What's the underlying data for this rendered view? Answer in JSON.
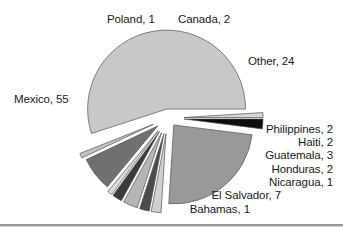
{
  "chart_data": {
    "type": "pie",
    "title": "",
    "subtitle": "",
    "xlabel": "",
    "ylabel": "",
    "legend_position": "none",
    "grid": false,
    "label_format": "{name}, {value}",
    "total": 100,
    "categories": [
      "Mexico",
      "Poland",
      "Canada",
      "Other",
      "Philippines",
      "Haiti",
      "Guatemala",
      "Honduras",
      "Nicaragua",
      "El Salvador",
      "Bahamas"
    ],
    "values": [
      55,
      1,
      2,
      24,
      2,
      2,
      3,
      2,
      1,
      7,
      1
    ],
    "slices": [
      {
        "name": "Mexico",
        "value": 55,
        "label": "Mexico, 55",
        "color": "#c8c8c8",
        "start_angle": 162,
        "end_angle": 360,
        "exploded": true
      },
      {
        "name": "Poland",
        "value": 1,
        "label": "Poland, 1",
        "color": "#d6d6d6",
        "start_angle": 356.4,
        "end_angle": 360,
        "exploded": true
      },
      {
        "name": "Canada",
        "value": 2,
        "label": "Canada, 2",
        "color": "#0d0d0d",
        "start_angle": 0,
        "end_angle": 7.2,
        "exploded": true
      },
      {
        "name": "Other",
        "value": 24,
        "label": "Other, 24",
        "color": "#999999",
        "start_angle": 7.2,
        "end_angle": 93.6,
        "exploded": true
      },
      {
        "name": "Philippines",
        "value": 2,
        "label": "Philippines, 2",
        "color": "#d0d0d0",
        "start_angle": 93.6,
        "end_angle": 100.8,
        "exploded": true
      },
      {
        "name": "Haiti",
        "value": 2,
        "label": "Haiti, 2",
        "color": "#4a4a4a",
        "start_angle": 100.8,
        "end_angle": 108,
        "exploded": true
      },
      {
        "name": "Guatemala",
        "value": 3,
        "label": "Guatemala, 3",
        "color": "#b5b5b5",
        "start_angle": 108,
        "end_angle": 118.8,
        "exploded": true
      },
      {
        "name": "Honduras",
        "value": 2,
        "label": "Honduras, 2",
        "color": "#3a3a3a",
        "start_angle": 118.8,
        "end_angle": 126,
        "exploded": true
      },
      {
        "name": "Nicaragua",
        "value": 1,
        "label": "Nicaragua, 1",
        "color": "#dcdcdc",
        "start_angle": 126,
        "end_angle": 129.6,
        "exploded": true
      },
      {
        "name": "El Salvador",
        "value": 7,
        "label": "El Salvador, 7",
        "color": "#707070",
        "start_angle": 129.6,
        "end_angle": 154.8,
        "exploded": true
      },
      {
        "name": "Bahamas",
        "value": 1,
        "label": "Bahamas, 1",
        "color": "#c2c2c2",
        "start_angle": 154.8,
        "end_angle": 158.4,
        "exploded": true
      }
    ]
  },
  "labels": {
    "poland": "Poland, 1",
    "canada": "Canada, 2",
    "other": "Other, 24",
    "mexico": "Mexico, 55",
    "philippines": "Philippines, 2",
    "haiti": "Haiti, 2",
    "guatemala": "Guatemala, 3",
    "honduras": "Honduras, 2",
    "nicaragua": "Nicaragua, 1",
    "el_salvador": "El Salvador, 7",
    "bahamas": "Bahamas, 1"
  },
  "colors": {
    "background": "#ffffff",
    "text": "#1a1a1a",
    "slice_outline": "#555555",
    "rule": "#9a9a9a"
  }
}
